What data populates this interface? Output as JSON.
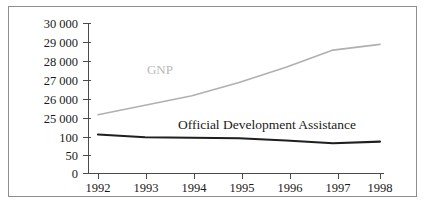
{
  "figure": {
    "background_color": "#ffffff",
    "frame_color": "#8e8e8e"
  },
  "chart_data": {
    "type": "line",
    "title": "",
    "subtitle": "",
    "xlabel": "",
    "ylabel": "",
    "grid": false,
    "legend_position": "inline-annotation",
    "broken_axis": true,
    "axis_note": "Y axis is broken: lower segment 0-100 for ODA, upper segment 25000-30000 for GNP",
    "x": [
      1992,
      1993,
      1994,
      1995,
      1996,
      1997,
      1998
    ],
    "categories": [
      "1992",
      "1993",
      "1994",
      "1995",
      "1996",
      "1997",
      "1998"
    ],
    "xtick_labels": [
      "1992",
      "1993",
      "1994",
      "1995",
      "1996",
      "1997",
      "1998"
    ],
    "ytick_labels": [
      "30 000",
      "29 000",
      "28 000",
      "27 000",
      "26 000",
      "25 000",
      "100",
      "50",
      "0"
    ],
    "ytick_values_upper": [
      30000,
      29000,
      28000,
      27000,
      26000,
      25000
    ],
    "ytick_values_lower": [
      100,
      50,
      0
    ],
    "ylim_upper": [
      25000,
      30000
    ],
    "ylim_lower": [
      0,
      100
    ],
    "series": [
      {
        "name": "GNP",
        "label": "GNP",
        "color": "#b0b0b0",
        "scale": "upper",
        "values": [
          25200,
          25700,
          26200,
          26900,
          27700,
          28600,
          28900
        ]
      },
      {
        "name": "Official Development Assistance",
        "label": "Official Development Assistance",
        "color": "#1f1f1f",
        "scale": "lower",
        "values": [
          71,
          66,
          65,
          64,
          60,
          55,
          58
        ]
      }
    ],
    "annotations": [
      {
        "text": "GNP",
        "x": 1994.0,
        "series": "GNP"
      },
      {
        "text": "Official Development Assistance",
        "x": 1995.6,
        "series": "Official Development Assistance"
      }
    ]
  }
}
